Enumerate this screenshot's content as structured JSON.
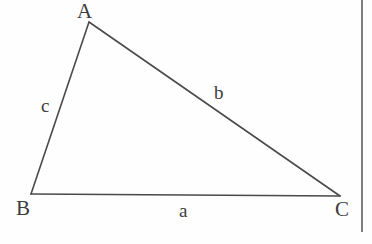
{
  "figure": {
    "background_color": "#fefefe",
    "stroke_color": "#4a4a4a",
    "stroke_width": 1.6,
    "text_color": "#3c3c3c",
    "vertices": [
      {
        "name": "A",
        "label": "A",
        "x": 89,
        "y": 22
      },
      {
        "name": "B",
        "label": "B",
        "x": 31,
        "y": 194
      },
      {
        "name": "C",
        "label": "C",
        "x": 340,
        "y": 196
      }
    ],
    "sides": [
      {
        "name": "a",
        "label": "a",
        "from": "B",
        "to": "C"
      },
      {
        "name": "b",
        "label": "b",
        "from": "A",
        "to": "C"
      },
      {
        "name": "c",
        "label": "c",
        "from": "A",
        "to": "B"
      }
    ]
  },
  "divider": {
    "name": "vertical-rule",
    "color": "#7e7e7e",
    "x": 361,
    "height": 232
  }
}
